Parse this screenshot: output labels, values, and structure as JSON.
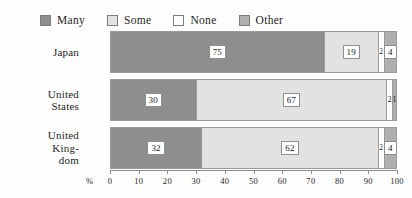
{
  "chart_data": {
    "type": "bar",
    "subtype": "horizontal-stacked-100",
    "title": "",
    "xlabel": "%",
    "ylabel": "",
    "xlim": [
      0,
      100
    ],
    "grid": false,
    "legend_position": "top",
    "categories": [
      "Japan",
      "United States",
      "United Kingdom"
    ],
    "category_labels": [
      [
        "Japan"
      ],
      [
        "United",
        "States"
      ],
      [
        "United",
        "King-",
        "dom"
      ]
    ],
    "series": [
      {
        "name": "Many",
        "color": "#8e8e8e",
        "values": [
          75,
          30,
          32
        ]
      },
      {
        "name": "Some",
        "color": "#e2e2e2",
        "values": [
          19,
          67,
          62
        ]
      },
      {
        "name": "None",
        "color": "#ffffff",
        "values": [
          2,
          2,
          2
        ]
      },
      {
        "name": "Other",
        "color": "#b0b0b0",
        "values": [
          4,
          1,
          4
        ]
      }
    ],
    "xticks": [
      0,
      10,
      20,
      30,
      40,
      50,
      60,
      70,
      80,
      90,
      100
    ],
    "xtick_labels": [
      "0",
      "10",
      "20",
      "30",
      "40",
      "50",
      "60",
      "70",
      "80",
      "90",
      "100"
    ]
  },
  "legend": {
    "items": [
      {
        "label": "Many",
        "swatch": "#8e8e8e"
      },
      {
        "label": "Some",
        "swatch": "#e2e2e2"
      },
      {
        "label": "None",
        "swatch": "#ffffff"
      },
      {
        "label": "Other",
        "swatch": "#b0b0b0"
      }
    ]
  },
  "axis": {
    "unit": "%"
  }
}
